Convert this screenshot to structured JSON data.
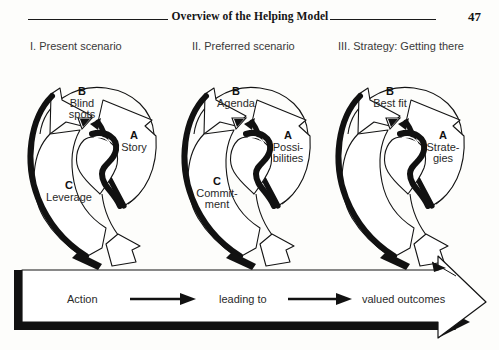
{
  "page": {
    "running_head": "Overview of the Helping Model",
    "page_number": "47",
    "background_color": "#fdfdfb",
    "ink_color": "#111111"
  },
  "columns": [
    {
      "heading": "I. Present scenario"
    },
    {
      "heading": "II. Preferred scenario"
    },
    {
      "heading": "III. Strategy: Getting there"
    }
  ],
  "panels": [
    {
      "name": "present-scenario",
      "stages": [
        {
          "key": "A",
          "label": "Story",
          "lines": [
            "Story"
          ]
        },
        {
          "key": "B",
          "label": "Blind spots",
          "lines": [
            "Blind",
            "spots"
          ]
        },
        {
          "key": "C",
          "label": "Leverage",
          "lines": [
            "Leverage"
          ]
        }
      ]
    },
    {
      "name": "preferred-scenario",
      "stages": [
        {
          "key": "A",
          "label": "Possibilities",
          "lines": [
            "Possi-",
            "bilities"
          ]
        },
        {
          "key": "B",
          "label": "Agenda",
          "lines": [
            "Agenda"
          ]
        },
        {
          "key": "C",
          "label": "Commitment",
          "lines": [
            "Commit-",
            "ment"
          ]
        }
      ]
    },
    {
      "name": "strategy-getting-there",
      "stages": [
        {
          "key": "A",
          "label": "Strategies",
          "lines": [
            "Strate-",
            "gies"
          ]
        },
        {
          "key": "B",
          "label": "Best fit",
          "lines": [
            "Best fit"
          ]
        }
      ]
    }
  ],
  "action_band": {
    "segments": [
      {
        "type": "text",
        "label": "Action"
      },
      {
        "type": "arrow",
        "label": "arrow-right-icon"
      },
      {
        "type": "text",
        "label": "leading to"
      },
      {
        "type": "arrow",
        "label": "arrow-right-icon"
      },
      {
        "type": "text",
        "label": "valued outcomes"
      }
    ]
  }
}
